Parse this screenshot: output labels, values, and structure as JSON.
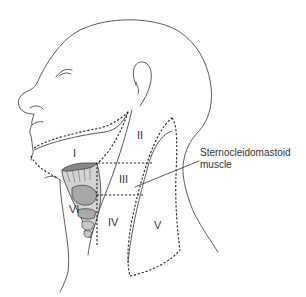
{
  "figure": {
    "levels": [
      {
        "id": "I",
        "label": "I"
      },
      {
        "id": "II",
        "label": "II"
      },
      {
        "id": "III",
        "label": "III"
      },
      {
        "id": "IV",
        "label": "IV"
      },
      {
        "id": "V",
        "label": "V"
      },
      {
        "id": "VI",
        "label": "VI"
      }
    ],
    "callout": {
      "line1": "Sternocleidomastoid",
      "line2": "muscle"
    },
    "colors": {
      "line": "#333333",
      "larynx_fill": "#a8a8a8",
      "background": "#ffffff"
    }
  }
}
